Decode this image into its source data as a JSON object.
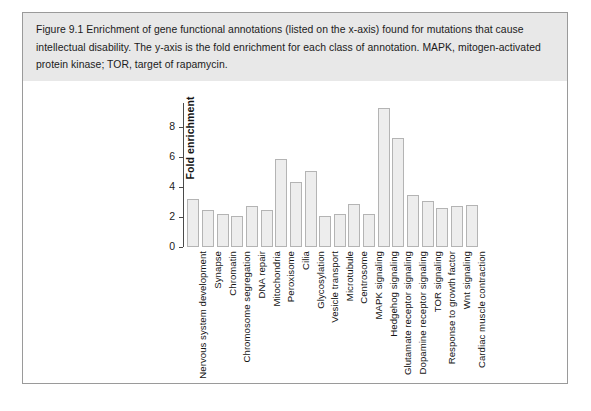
{
  "figure": {
    "label": "Figure 9.1",
    "caption": "Figure 9.1   Enrichment of gene functional annotations (listed on the x-axis) found for mutations that cause intellectual disability. The y-axis is the fold enrichment for each class of annotation. MAPK, mitogen-activated protein kinase; TOR, target of rapamycin.",
    "caption_background": "#e8e8e8",
    "border_color": "#9a9a9a"
  },
  "chart_data": {
    "type": "bar",
    "title": "",
    "xlabel": "",
    "ylabel": "Fold enrichment",
    "ylim": [
      0,
      9.6
    ],
    "yticks": [
      0,
      2,
      4,
      6,
      8
    ],
    "ytick_labels": [
      "0",
      "2",
      "4",
      "6",
      "8"
    ],
    "grid": false,
    "legend": "none",
    "bar_fill": "#ededed",
    "bar_edge": "#b4b4b4",
    "categories": [
      "Nervous system development",
      "Synapse",
      "Chromatin",
      "Chromosome segregation",
      "DNA repair",
      "Mitochondria",
      "Peroxisome",
      "Cilia",
      "Glycosylation",
      "Vesicle transport",
      "Microtubule",
      "Centrosome",
      "MAPK signaling",
      "Hedgehog signaling",
      "Glutamate receptor signaling",
      "Dopamine receptor signaling",
      "TOR signaling",
      "Response to growth factor",
      "Wnt signaling",
      "Cardiac muscle contraction"
    ],
    "values": [
      3.2,
      2.5,
      2.2,
      2.05,
      2.75,
      2.45,
      5.85,
      4.35,
      5.05,
      2.1,
      2.2,
      2.85,
      2.2,
      9.25,
      7.3,
      3.45,
      3.1,
      2.6,
      2.75,
      2.8
    ]
  }
}
